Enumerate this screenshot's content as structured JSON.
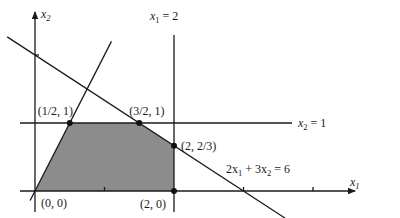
{
  "diagram": {
    "type": "linear-programming-feasible-region",
    "axes": {
      "x": {
        "label": "x",
        "subscript": "1",
        "ticks": [
          1,
          3,
          4
        ]
      },
      "y": {
        "label": "x",
        "subscript": "2",
        "ticks": [
          2
        ]
      }
    },
    "constraint_labels": {
      "vertical": {
        "pre": "x",
        "sub": "1",
        "post": " = 2"
      },
      "horizontal": {
        "pre": "x",
        "sub": "2",
        "post": " = 1"
      },
      "diagonal": {
        "a": "2x",
        "asub": "1",
        "mid": " +  3x",
        "bsub": "2",
        "post": " = 6"
      }
    },
    "constraints": [
      {
        "name": "x1 = 2",
        "kind": "vertical",
        "value": 2
      },
      {
        "name": "x2 = 1",
        "kind": "horizontal",
        "value": 1
      },
      {
        "name": "2x1 + 3x2 = 6",
        "a": 2,
        "b": 3,
        "c": 6
      },
      {
        "name": "x2 = 2x1",
        "slope": 2
      }
    ],
    "vertices": [
      {
        "x": 0,
        "y": 0,
        "label": "(0, 0)"
      },
      {
        "x": 0.5,
        "y": 1,
        "label": "(1/2, 1)"
      },
      {
        "x": 1.5,
        "y": 1,
        "label": "(3/2, 1)"
      },
      {
        "x": 2,
        "y": 0.6667,
        "label": "(2, 2/3)"
      },
      {
        "x": 2,
        "y": 0,
        "label": "(2, 0)"
      }
    ],
    "region_color": "#8c8c8c",
    "line_color": "#1a1a1a"
  }
}
